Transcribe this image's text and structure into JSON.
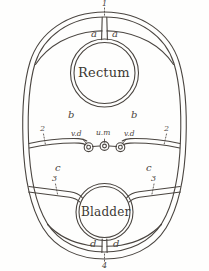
{
  "figure": {
    "ink_color": "#4a4540",
    "paper_color": "#fefefd",
    "organs": {
      "rectum": "Rectum",
      "bladder": "Bladder"
    },
    "labels": {
      "top_number": "1",
      "bottom_number": "4",
      "a_left": "a",
      "a_right": "a",
      "b_left": "b",
      "b_right": "b",
      "c_left": "c",
      "c_right": "c",
      "d_left": "d",
      "d_right": "d",
      "two_left": "2",
      "two_right": "2",
      "three_left": "3",
      "three_right": "3",
      "vd_left": "v.d",
      "um_center": "u.m",
      "vd_right": "v.d"
    }
  }
}
